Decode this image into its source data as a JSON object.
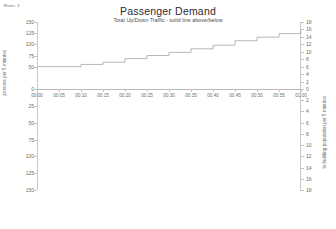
{
  "runs_label": "Runs: 1",
  "header": {
    "title": "Passenger Demand",
    "subtitle": "Total Up/Down Traffic - solid line above/below"
  },
  "axes": {
    "left_title": "persons per 5 minutes",
    "right_title": "% building population per 5 minutes",
    "left_ticks_upper": [
      "150",
      "125",
      "100",
      "75",
      "50"
    ],
    "left_ticks_lower": [
      "25",
      "50",
      "75",
      "100",
      "125",
      "150"
    ],
    "left_zero": "0",
    "right_ticks_upper": [
      "18",
      "16",
      "14",
      "12",
      "10",
      "8",
      "6",
      "4",
      "2"
    ],
    "right_zero": "0",
    "right_ticks_lower": [
      "2",
      "4",
      "6",
      "8",
      "10",
      "12",
      "14",
      "16",
      "18"
    ],
    "x_ticks": [
      "00:00",
      "00:05",
      "00:10",
      "00:15",
      "00:20",
      "00:25",
      "00:30",
      "00:35",
      "00:40",
      "00:45",
      "00:50",
      "00:55",
      "01:00"
    ]
  },
  "chart_data": {
    "type": "line",
    "title": "Passenger Demand",
    "subtitle": "Total Up/Down Traffic - solid line above/below",
    "xlabel": "",
    "ylabel": "persons per 5 minutes",
    "ylabel_secondary": "% building population per 5 minutes",
    "x": [
      "00:00",
      "00:05",
      "00:10",
      "00:15",
      "00:20",
      "00:25",
      "00:30",
      "00:35",
      "00:40",
      "00:45",
      "00:50",
      "00:55",
      "01:00"
    ],
    "ylim": [
      -150,
      150
    ],
    "ylim_secondary": [
      -18,
      18
    ],
    "grid": false,
    "legend": "none",
    "series": [
      {
        "name": "Up traffic (persons per 5 minutes)",
        "style": "step",
        "color": "#9a9a9a",
        "values": [
          50,
          50,
          55,
          60,
          68,
          75,
          82,
          90,
          98,
          108,
          116,
          124,
          130
        ]
      }
    ]
  }
}
